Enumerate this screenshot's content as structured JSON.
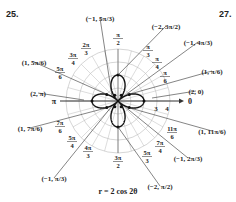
{
  "exercise_left": "25.",
  "exercise_right": "27.",
  "chart_data": {
    "type": "polar",
    "title": "",
    "equation": "r = 2 cos 2θ",
    "curve": "four-petaled rose",
    "radial_ticks": [
      "3",
      "4"
    ],
    "rings": [
      1,
      2,
      3,
      4
    ],
    "axis_labels": {
      "zero": "0",
      "pi": "π"
    },
    "angle_labels": [
      "π/6",
      "π/4",
      "π/3",
      "π/2",
      "2π/3",
      "3π/4",
      "5π/6",
      "7π/6",
      "5π/4",
      "4π/3",
      "3π/2",
      "5π/3",
      "7π/4",
      "11π/6"
    ],
    "points": [
      {
        "label": "(2, 0)",
        "r": 2,
        "theta": "0"
      },
      {
        "label": "(1, π/6)",
        "r": 1,
        "theta": "π/6"
      },
      {
        "label": "(−1, 4π/3)",
        "r": -1,
        "theta": "4π/3"
      },
      {
        "label": "(−2, 3π/2)",
        "r": -2,
        "theta": "3π/2"
      },
      {
        "label": "(−1, 5π/3)",
        "r": -1,
        "theta": "5π/3"
      },
      {
        "label": "(1, 5π/6)",
        "r": 1,
        "theta": "5π/6"
      },
      {
        "label": "(2, π)",
        "r": 2,
        "theta": "π"
      },
      {
        "label": "(1, 7π/6)",
        "r": 1,
        "theta": "7π/6"
      },
      {
        "label": "(−1, π/3)",
        "r": -1,
        "theta": "π/3"
      },
      {
        "label": "(−2, π/2)",
        "r": -2,
        "theta": "π/2"
      },
      {
        "label": "(−1, 2π/3)",
        "r": -1,
        "theta": "2π/3"
      },
      {
        "label": "(1, 11π/6)",
        "r": 1,
        "theta": "11π/6"
      }
    ]
  }
}
